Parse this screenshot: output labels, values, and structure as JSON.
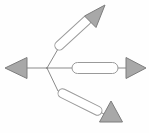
{
  "diagram": {
    "background_color": "#fefefe",
    "line_color": "#8a8a8a",
    "capsule_fill": "#ffffff",
    "capsule_stroke": "#9a9a9a",
    "arrowhead_fill": "#a8a8a8",
    "arrowhead_stroke": "#7d7d7d",
    "width": 149,
    "height": 133,
    "junction": {
      "x": 47,
      "y": 68
    },
    "branches": [
      {
        "name": "left-branch",
        "direction": "left",
        "angle_deg": 180,
        "has_capsule": false,
        "stem": {
          "x1": 47,
          "y1": 68,
          "x2": 26,
          "y2": 68
        },
        "arrowhead": {
          "tip_x": 5,
          "tip_y": 68,
          "base_x": 26,
          "half_width": 11
        }
      },
      {
        "name": "upper-right-branch",
        "direction": "up-right",
        "angle_deg": 45,
        "has_capsule": true,
        "stem": {
          "x1": 47,
          "y1": 68,
          "x2": 57,
          "y2": 49
        },
        "capsule": {
          "cx": 73,
          "cy": 34,
          "length": 44,
          "thickness": 9,
          "rotation_deg": -48
        },
        "arrowhead": {
          "tip_x": 105,
          "tip_y": 5,
          "base_x": 89,
          "base_y": 22,
          "half_width": 11
        }
      },
      {
        "name": "middle-right-branch",
        "direction": "right",
        "angle_deg": 0,
        "has_capsule": true,
        "stem": {
          "x1": 47,
          "y1": 68,
          "x2": 126,
          "y2": 68
        },
        "capsule": {
          "cx": 95,
          "cy": 68,
          "length": 46,
          "thickness": 10,
          "rotation_deg": 0
        },
        "arrowhead": {
          "tip_x": 146,
          "tip_y": 68,
          "base_x": 126,
          "half_width": 11
        }
      },
      {
        "name": "lower-right-branch",
        "direction": "down-right",
        "angle_deg": -60,
        "has_capsule": true,
        "stem": {
          "x1": 47,
          "y1": 68,
          "x2": 57,
          "y2": 91
        },
        "capsule": {
          "cx": 79,
          "cy": 103,
          "length": 48,
          "thickness": 9,
          "rotation_deg": 29
        },
        "arrowhead": {
          "tip_x": 122,
          "tip_y": 122,
          "base_x": 101,
          "base_y": 122,
          "half_width": 11
        }
      }
    ]
  }
}
